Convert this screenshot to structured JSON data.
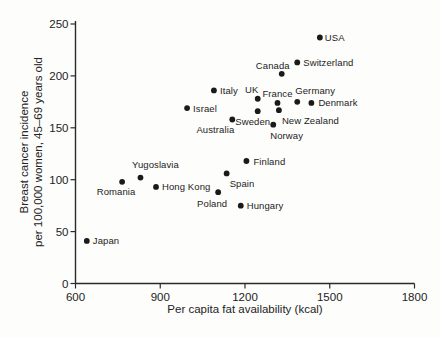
{
  "chart_data": {
    "type": "scatter",
    "title": "",
    "xlabel": "Per capita fat availability (kcal)",
    "ylabel_line1": "Breast cancer incidence",
    "ylabel_line2": "per 100,000 women, 45–69 years old",
    "xlim": [
      600,
      1800
    ],
    "ylim": [
      0,
      250
    ],
    "x_ticks": [
      600,
      900,
      1200,
      1500,
      1800
    ],
    "y_ticks": [
      0,
      50,
      100,
      150,
      200,
      250
    ],
    "grid": false,
    "legend": "none",
    "marker_color": "#1a1a1a",
    "axis_color": "#2a2a2a",
    "points": [
      {
        "label": "Japan",
        "x": 640,
        "y": 41,
        "anchor": "start",
        "dx": 6,
        "dy": 0
      },
      {
        "label": "Romania",
        "x": 765,
        "y": 98,
        "anchor": "middle",
        "dx": -6,
        "dy": 10
      },
      {
        "label": "Yugoslavia",
        "x": 830,
        "y": 102,
        "anchor": "middle",
        "dx": 15,
        "dy": -13
      },
      {
        "label": "Hong Kong",
        "x": 885,
        "y": 93,
        "anchor": "start",
        "dx": 6,
        "dy": 0
      },
      {
        "label": "Israel",
        "x": 995,
        "y": 169,
        "anchor": "start",
        "dx": 6,
        "dy": 0
      },
      {
        "label": "Italy",
        "x": 1090,
        "y": 186,
        "anchor": "start",
        "dx": 6,
        "dy": 0
      },
      {
        "label": "Poland",
        "x": 1105,
        "y": 88,
        "anchor": "middle",
        "dx": -6,
        "dy": 11
      },
      {
        "label": "Spain",
        "x": 1135,
        "y": 106,
        "anchor": "start",
        "dx": 3,
        "dy": 10
      },
      {
        "label": "Australia",
        "x": 1155,
        "y": 158,
        "anchor": "end",
        "dx": 2,
        "dy": 10
      },
      {
        "label": "Finland",
        "x": 1205,
        "y": 118,
        "anchor": "start",
        "dx": 7,
        "dy": 0
      },
      {
        "label": "Hungary",
        "x": 1185,
        "y": 75,
        "anchor": "start",
        "dx": 6,
        "dy": 0
      },
      {
        "label": "UK",
        "x": 1245,
        "y": 178,
        "anchor": "middle",
        "dx": -6,
        "dy": -9
      },
      {
        "label": "Sweden",
        "x": 1245,
        "y": 166,
        "anchor": "middle",
        "dx": -5,
        "dy": 10
      },
      {
        "label": "France",
        "x": 1315,
        "y": 174,
        "anchor": "middle",
        "dx": 0,
        "dy": -9
      },
      {
        "label": "New Zealand",
        "x": 1320,
        "y": 167,
        "anchor": "start",
        "dx": 3,
        "dy": 10
      },
      {
        "label": "Norway",
        "x": 1300,
        "y": 153,
        "anchor": "start",
        "dx": -3,
        "dy": 11
      },
      {
        "label": "Germany",
        "x": 1385,
        "y": 175,
        "anchor": "start",
        "dx": -2,
        "dy": -11
      },
      {
        "label": "Denmark",
        "x": 1435,
        "y": 174,
        "anchor": "start",
        "dx": 7,
        "dy": 0
      },
      {
        "label": "Canada",
        "x": 1330,
        "y": 202,
        "anchor": "end",
        "dx": 8,
        "dy": -8
      },
      {
        "label": "Switzerland",
        "x": 1385,
        "y": 213,
        "anchor": "start",
        "dx": 6,
        "dy": 0
      },
      {
        "label": "USA",
        "x": 1465,
        "y": 237,
        "anchor": "start",
        "dx": 5,
        "dy": 0
      }
    ]
  }
}
